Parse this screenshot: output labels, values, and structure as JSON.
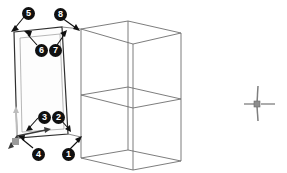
{
  "viewport": {
    "name": "3d-model-viewport",
    "background_color": "#ffffff",
    "width": 287,
    "height": 173
  },
  "colors": {
    "wireframe": "#6e6e6e",
    "wireframe_dark": "#4a4a4a",
    "selected_face_outline": "#2a2a2a",
    "selected_face_fill": "#fdfdfd",
    "callout_background": "#101010",
    "callout_text": "#ffffff",
    "leader_line": "#101010",
    "axis_gizmo_z": "#b8b8b8",
    "axis_gizmo_x": "#3a3a3a",
    "axis_gizmo_y": "#3a3a3a",
    "axis_gizmo_origin": "#8a8a8a",
    "crosshair": "#8d8d8d"
  },
  "callouts": [
    {
      "label": "1",
      "badge_x": 62,
      "badge_y": 148,
      "tip_x": 80,
      "tip_y": 138
    },
    {
      "label": "2",
      "badge_x": 52,
      "badge_y": 111,
      "tip_x": 70,
      "tip_y": 130
    },
    {
      "label": "3",
      "badge_x": 38,
      "badge_y": 111,
      "tip_x": 26,
      "tip_y": 130
    },
    {
      "label": "4",
      "badge_x": 32,
      "badge_y": 148,
      "tip_x": 17,
      "tip_y": 136
    },
    {
      "label": "5",
      "badge_x": 22,
      "badge_y": 7,
      "tip_x": 12,
      "tip_y": 30
    },
    {
      "label": "6",
      "badge_x": 35,
      "badge_y": 44,
      "tip_x": 25,
      "tip_y": 32
    },
    {
      "label": "7",
      "badge_x": 49,
      "badge_y": 44,
      "tip_x": 62,
      "tip_y": 31
    },
    {
      "label": "8",
      "badge_x": 54,
      "badge_y": 8,
      "tip_x": 79,
      "tip_y": 29
    }
  ],
  "geometry": {
    "box_top_face": "81,29 128,21 181,33 133,44",
    "box_mid_face": "81,95 128,87 181,99 133,108",
    "box_bottom_face": "81,158 128,150 181,161 133,170",
    "box_vertical_left": "81,29 81,158",
    "box_vertical_back": "128,21 128,150",
    "box_vertical_right": "181,33 181,161",
    "box_vertical_front": "133,44 133,170",
    "selected_face": "14,32 62,27 68,134 17,138",
    "selected_face_inner": "20,38 60,34 64,129 22,132"
  },
  "axis_gizmo": {
    "name": "axis-gizmo-origin",
    "origin_x": 17,
    "origin_y": 136,
    "z_tip_x": 16,
    "z_tip_y": 108,
    "x_tip_x": 51,
    "x_tip_y": 130,
    "y_tip_x": 8,
    "y_tip_y": 147
  },
  "crosshair_marker": {
    "name": "crosshair-pivot-marker",
    "center_x": 258,
    "center_y": 104,
    "arm_up": 18,
    "arm_down": 16,
    "arm_left": 14,
    "arm_right": 17
  }
}
